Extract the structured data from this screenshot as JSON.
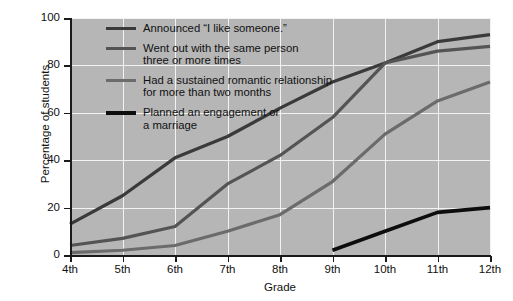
{
  "chart_data": {
    "type": "line",
    "title": "",
    "xlabel": "Grade",
    "ylabel": "Percentage of students",
    "categories": [
      "4th",
      "5th",
      "6th",
      "7th",
      "8th",
      "9th",
      "10th",
      "11th",
      "12th"
    ],
    "xlim": [
      0,
      8
    ],
    "ylim": [
      0,
      100
    ],
    "yticks": [
      0,
      20,
      40,
      60,
      80,
      100
    ],
    "grid": true,
    "legend_position": "upper-left-inside",
    "plot_background": "#b6b6b6",
    "gridline_color": "#f2f2f2",
    "series": [
      {
        "name": "Announced \"I like someone.\"",
        "color": "#3a3a3a",
        "width": 3.2,
        "x": [
          "4th",
          "5th",
          "6th",
          "7th",
          "8th",
          "9th",
          "10th",
          "11th",
          "12th"
        ],
        "values": [
          13,
          25,
          41,
          50,
          62,
          73,
          81,
          90,
          93
        ]
      },
      {
        "name": "Went out with the same person\nthree or more times",
        "color": "#545454",
        "width": 3.2,
        "x": [
          "4th",
          "5th",
          "6th",
          "7th",
          "8th",
          "9th",
          "10th",
          "11th",
          "12th"
        ],
        "values": [
          4,
          7,
          12,
          30,
          42,
          58,
          81,
          86,
          88
        ]
      },
      {
        "name": "Had a sustained romantic relationship\nfor more than two months",
        "color": "#6b6b6b",
        "width": 3.2,
        "x": [
          "4th",
          "5th",
          "6th",
          "7th",
          "8th",
          "9th",
          "10th",
          "11th",
          "12th"
        ],
        "values": [
          1,
          2,
          4,
          10,
          17,
          31,
          51,
          65,
          73
        ]
      },
      {
        "name": "Planned an engagement or\na marriage",
        "color": "#0d0d0d",
        "width": 3.6,
        "x": [
          "9th",
          "10th",
          "11th",
          "12th"
        ],
        "values": [
          2,
          10,
          18,
          20
        ]
      }
    ]
  },
  "legend": {
    "items": [
      {
        "label": "Announced “I like someone.”"
      },
      {
        "label": "Went out with the same person\nthree or more times"
      },
      {
        "label": "Had a sustained romantic relationship\nfor more than two months"
      },
      {
        "label": "Planned an engagement or\na marriage"
      }
    ]
  }
}
